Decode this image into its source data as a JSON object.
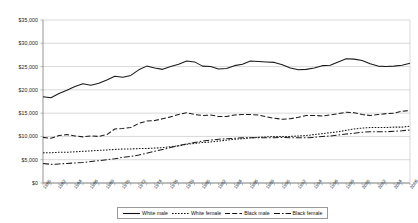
{
  "chart_data": {
    "type": "line",
    "title": "",
    "xlabel": "",
    "ylabel": "",
    "ylim": [
      0,
      35000
    ],
    "ytick_values": [
      0,
      5000,
      10000,
      15000,
      20000,
      25000,
      30000,
      35000
    ],
    "ytick_labels": [
      "$0",
      "$5,000",
      "$10,000",
      "$15,000",
      "$20,000",
      "$25,000",
      "$30,000",
      "$35,000"
    ],
    "grid": true,
    "grid_axis": "y",
    "legend_position": "bottom",
    "x": [
      1960,
      1961,
      1962,
      1963,
      1964,
      1965,
      1966,
      1967,
      1968,
      1969,
      1970,
      1971,
      1972,
      1973,
      1974,
      1975,
      1976,
      1977,
      1978,
      1979,
      1980,
      1981,
      1982,
      1983,
      1984,
      1985,
      1986,
      1987,
      1988,
      1989,
      1990,
      1991,
      1992,
      1993,
      1994,
      1995,
      1996,
      1997,
      1998,
      1999,
      2000,
      2001,
      2002,
      2003,
      2004,
      2005,
      2006
    ],
    "xtick_labels": [
      "1960",
      "1962",
      "1964",
      "1966",
      "1968",
      "1970",
      "1972",
      "1974",
      "1976",
      "1978",
      "1980",
      "1982",
      "1984",
      "1986",
      "1988",
      "1990",
      "1992",
      "1994",
      "1996",
      "1998",
      "2000",
      "2002",
      "2004",
      "2006"
    ],
    "xtick_step": 2,
    "series": [
      {
        "name": "White male",
        "style": "solid",
        "color": "#1a1a1a",
        "values": [
          18500,
          18300,
          19200,
          19900,
          20700,
          21300,
          21000,
          21400,
          22100,
          22900,
          22700,
          23100,
          24300,
          25100,
          24700,
          24400,
          25000,
          25500,
          26200,
          26000,
          25100,
          25000,
          24500,
          24600,
          25200,
          25500,
          26200,
          26100,
          26000,
          25900,
          25400,
          24700,
          24300,
          24400,
          24700,
          25200,
          25300,
          26000,
          26700,
          26600,
          26300,
          25600,
          25100,
          25000,
          25100,
          25300,
          25700
        ]
      },
      {
        "name": "White female",
        "style": "dotted",
        "color": "#1a1a1a",
        "values": [
          6500,
          6500,
          6600,
          6600,
          6700,
          6800,
          6900,
          7000,
          7100,
          7200,
          7300,
          7300,
          7400,
          7400,
          7500,
          7600,
          7800,
          8000,
          8300,
          8500,
          8700,
          8800,
          9000,
          9200,
          9400,
          9500,
          9700,
          9800,
          9900,
          10000,
          10000,
          10000,
          10100,
          10200,
          10400,
          10600,
          10800,
          11000,
          11300,
          11600,
          11800,
          11900,
          11900,
          11900,
          12000,
          12000,
          12200
        ]
      },
      {
        "name": "Black male",
        "style": "dashed",
        "color": "#1a1a1a",
        "values": [
          9800,
          9600,
          10200,
          10400,
          10100,
          9900,
          10100,
          10000,
          10400,
          11600,
          11700,
          11900,
          12800,
          13300,
          13400,
          13800,
          14200,
          14700,
          15100,
          14700,
          14500,
          14600,
          14300,
          14300,
          14600,
          14700,
          14700,
          14600,
          14200,
          13900,
          13700,
          13800,
          14100,
          14500,
          14500,
          14400,
          14600,
          14900,
          15200,
          15100,
          14700,
          14500,
          14700,
          14900,
          15000,
          15400,
          15600
        ]
      },
      {
        "name": "Black female",
        "style": "dashdot",
        "color": "#1a1a1a",
        "values": [
          4200,
          4000,
          4100,
          4200,
          4300,
          4400,
          4600,
          4800,
          5000,
          5200,
          5500,
          5700,
          6000,
          6400,
          6800,
          7200,
          7600,
          8000,
          8400,
          8700,
          9000,
          9200,
          9400,
          9500,
          9600,
          9700,
          9700,
          9700,
          9700,
          9700,
          9800,
          9700,
          9700,
          9700,
          9800,
          10000,
          10100,
          10300,
          10500,
          10700,
          10900,
          11000,
          11000,
          11000,
          11100,
          11200,
          11400
        ]
      }
    ]
  },
  "legend": {
    "entries": [
      {
        "label": "White male",
        "style": "solid"
      },
      {
        "label": "White female",
        "style": "dotted"
      },
      {
        "label": "Black male",
        "style": "dashed"
      },
      {
        "label": "Black female",
        "style": "dashdot"
      }
    ]
  }
}
